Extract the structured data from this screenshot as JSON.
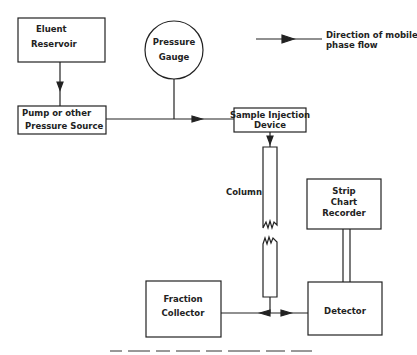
{
  "diagram": {
    "type": "flowchart",
    "legend": {
      "arrow_label_line1": "Direction of mobile",
      "arrow_label_line2": "phase flow"
    },
    "nodes": {
      "eluent_reservoir": {
        "line1": "Eluent",
        "line2": "Reservoir"
      },
      "pump": {
        "line1": "Pump or other",
        "line2": "Pressure  Source"
      },
      "pressure_gauge": {
        "line1": "Pressure",
        "line2": "Gauge"
      },
      "sample_injection": {
        "line1": "Sample Injection",
        "line2": "Device"
      },
      "column": {
        "label": "Column"
      },
      "strip_chart": {
        "line1": "Strip",
        "line2": "Chart",
        "line3": "Recorder"
      },
      "fraction_collector": {
        "line1": "Fraction",
        "line2": "Collector"
      },
      "detector": {
        "label": "Detector"
      }
    },
    "edges": [
      {
        "from": "Eluent Reservoir",
        "to": "Pump or other Pressure Source"
      },
      {
        "from": "Pump or other Pressure Source",
        "to": "Sample Injection Device"
      },
      {
        "from": "Pressure Gauge",
        "to": "Pump line"
      },
      {
        "from": "Sample Injection Device",
        "to": "Column"
      },
      {
        "from": "Column",
        "to": "Fraction Collector"
      },
      {
        "from": "Column",
        "to": "Detector"
      },
      {
        "from": "Detector",
        "to": "Strip Chart Recorder"
      }
    ]
  }
}
